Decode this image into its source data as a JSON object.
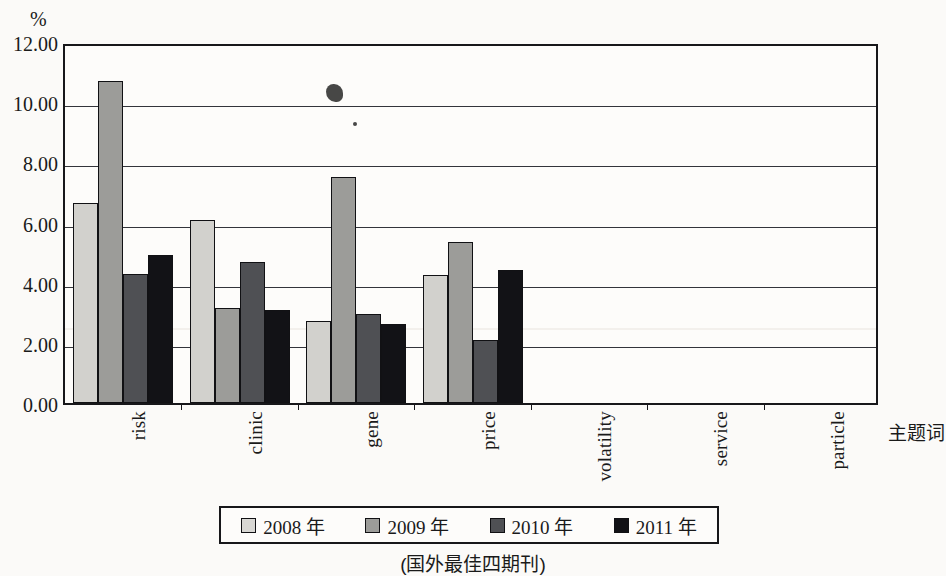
{
  "chart_data": {
    "type": "bar",
    "title": "",
    "xlabel": "主题词",
    "ylabel": "%",
    "ylim": [
      0,
      12
    ],
    "ytick_values": [
      12,
      10,
      8,
      6,
      4,
      2,
      0
    ],
    "ytick_labels": [
      "12.00",
      "10.00",
      "8.00",
      "6.00",
      "4.00",
      "2.00",
      "0.00"
    ],
    "grid": true,
    "legend_position": "bottom",
    "categories": [
      "risk",
      "clinic",
      "gene",
      "price",
      "volatility",
      "service",
      "particle"
    ],
    "series": [
      {
        "name": "2008 年",
        "color": "#d2d1cd",
        "values": [
          6.65,
          6.1,
          2.73,
          4.25,
          0,
          0,
          0
        ]
      },
      {
        "name": "2009 年",
        "color": "#9c9c99",
        "values": [
          10.7,
          3.15,
          7.52,
          5.35,
          0,
          0,
          0
        ]
      },
      {
        "name": "2010 年",
        "color": "#4f5054",
        "values": [
          4.28,
          4.7,
          2.97,
          2.08,
          0,
          0,
          0
        ]
      },
      {
        "name": "2011 年",
        "color": "#121216",
        "values": [
          4.93,
          3.1,
          2.62,
          4.42,
          0,
          0,
          0
        ]
      }
    ],
    "caption": "(国外最佳四期刊)"
  },
  "axis": {
    "unit_symbol": "%",
    "x_title": "主题词"
  },
  "legend": {
    "entries": [
      {
        "label": "2008 年"
      },
      {
        "label": "2009 年"
      },
      {
        "label": "2010 年"
      },
      {
        "label": "2011 年"
      }
    ]
  },
  "caption": {
    "text": "(国外最佳四期刊)"
  }
}
